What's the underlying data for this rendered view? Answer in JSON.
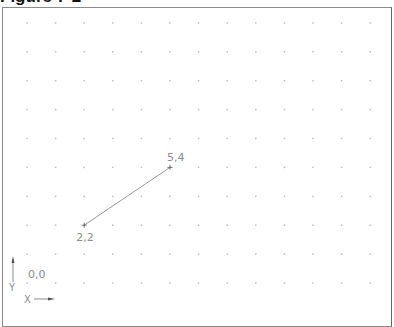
{
  "figure": {
    "title": "Figure 7-2"
  },
  "grid": {
    "columns": 13,
    "rows": 10,
    "origin_px": [
      27,
      283
    ],
    "spacing_x": 28.6,
    "spacing_y": 28.9,
    "dot_color": "#bdbdbd"
  },
  "line": {
    "start": {
      "x": 2,
      "y": 2,
      "label": "2,2"
    },
    "end": {
      "x": 5,
      "y": 4,
      "label": "5,4"
    },
    "color": "#9a9a9a"
  },
  "origin": {
    "label": "0,0"
  },
  "ucs_icon": {
    "x_label": "X",
    "y_label": "Y"
  },
  "colors": {
    "text": "#8c8c8c",
    "border": "#7a7a7a",
    "background": "#ffffff"
  }
}
